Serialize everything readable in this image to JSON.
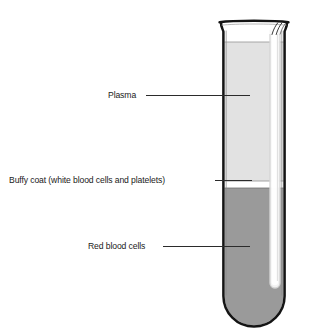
{
  "diagram": {
    "labels": [
      {
        "id": "plasma",
        "text": "Plasma",
        "points_to": "plasma-layer"
      },
      {
        "id": "buffy-coat",
        "text": "Buffy coat (white blood cells and platelets)",
        "points_to": "buffy-coat-layer"
      },
      {
        "id": "red-blood-cells",
        "text": "Red blood cells",
        "points_to": "red-blood-cell-layer"
      }
    ],
    "layers": [
      {
        "id": "plasma-layer",
        "name": "Plasma",
        "color": "#e2e2e2"
      },
      {
        "id": "buffy-coat-layer",
        "name": "Buffy coat",
        "color": "#ffffff"
      },
      {
        "id": "red-blood-cell-layer",
        "name": "Red blood cells",
        "color": "#9a9a9a"
      }
    ],
    "colors": {
      "outline": "#1a1a1a",
      "plasma": "#e2e2e2",
      "buffy_coat": "#ffffff",
      "red_blood_cells": "#9a9a9a",
      "glass_highlight": "#f6f6f6",
      "leader_line": "#2b2b2b",
      "background": "#ffffff",
      "text": "#1a1a1a"
    }
  }
}
